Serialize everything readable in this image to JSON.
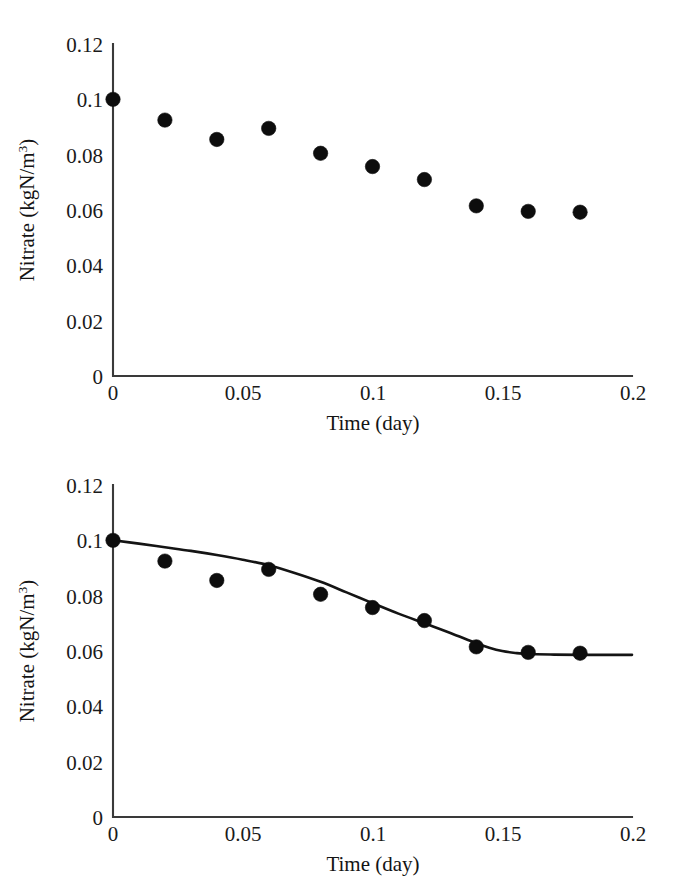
{
  "figure": {
    "panels": [
      {
        "id": "panel-top",
        "name": "scatter-only-panel",
        "xlabel": "Time (day)",
        "ylabel_main": "Nitrate (kgN/m",
        "ylabel_sup": "3",
        "ylabel_tail": ")"
      },
      {
        "id": "panel-bottom",
        "name": "scatter-with-fit-panel",
        "xlabel": "Time (day)",
        "ylabel_main": "Nitrate (kgN/m",
        "ylabel_sup": "3",
        "ylabel_tail": ")"
      }
    ],
    "yticks": [
      "0",
      "0.02",
      "0.04",
      "0.06",
      "0.08",
      "0.1",
      "0.12"
    ],
    "xticks": [
      "0",
      "0.05",
      "0.1",
      "0.15",
      "0.2"
    ]
  },
  "chart_data": [
    {
      "type": "scatter",
      "panel": "top",
      "title": "",
      "xlabel": "Time (day)",
      "ylabel": "Nitrate (kgN/m^3)",
      "xlim": [
        0,
        0.2
      ],
      "ylim": [
        0,
        0.12
      ],
      "xticks": [
        0,
        0.05,
        0.1,
        0.15,
        0.2
      ],
      "yticks": [
        0,
        0.02,
        0.04,
        0.06,
        0.08,
        0.1,
        0.12
      ],
      "grid": false,
      "legend": "none",
      "series": [
        {
          "name": "measured nitrate",
          "marker": "filled-circle",
          "color": "#0d0d0d",
          "x": [
            0.0,
            0.02,
            0.04,
            0.06,
            0.08,
            0.1,
            0.12,
            0.14,
            0.16,
            0.18
          ],
          "y": [
            0.1,
            0.0925,
            0.0855,
            0.0895,
            0.0805,
            0.0757,
            0.071,
            0.0615,
            0.0595,
            0.0592
          ]
        }
      ]
    },
    {
      "type": "scatter",
      "panel": "bottom",
      "title": "",
      "xlabel": "Time (day)",
      "ylabel": "Nitrate (kgN/m^3)",
      "xlim": [
        0,
        0.2
      ],
      "ylim": [
        0,
        0.12
      ],
      "xticks": [
        0,
        0.05,
        0.1,
        0.15,
        0.2
      ],
      "yticks": [
        0,
        0.02,
        0.04,
        0.06,
        0.08,
        0.1,
        0.12
      ],
      "grid": false,
      "legend": "none",
      "series": [
        {
          "name": "measured nitrate",
          "marker": "filled-circle",
          "color": "#0d0d0d",
          "x": [
            0.0,
            0.02,
            0.04,
            0.06,
            0.08,
            0.1,
            0.12,
            0.14,
            0.16,
            0.18
          ],
          "y": [
            0.1,
            0.0925,
            0.0855,
            0.0895,
            0.0805,
            0.0757,
            0.071,
            0.0615,
            0.0595,
            0.0592
          ]
        },
        {
          "name": "model fit",
          "marker": "none",
          "style": "solid-line",
          "color": "#141414",
          "x": [
            0.0,
            0.01,
            0.02,
            0.03,
            0.04,
            0.05,
            0.06,
            0.07,
            0.08,
            0.09,
            0.1,
            0.11,
            0.12,
            0.13,
            0.14,
            0.145,
            0.15,
            0.155,
            0.16,
            0.17,
            0.18,
            0.19,
            0.2
          ],
          "y": [
            0.1,
            0.0988,
            0.0975,
            0.0962,
            0.0947,
            0.093,
            0.091,
            0.0882,
            0.085,
            0.0812,
            0.0773,
            0.0735,
            0.07,
            0.0665,
            0.0628,
            0.0612,
            0.06,
            0.0593,
            0.0589,
            0.0587,
            0.0586,
            0.0586,
            0.0586
          ]
        }
      ]
    }
  ]
}
